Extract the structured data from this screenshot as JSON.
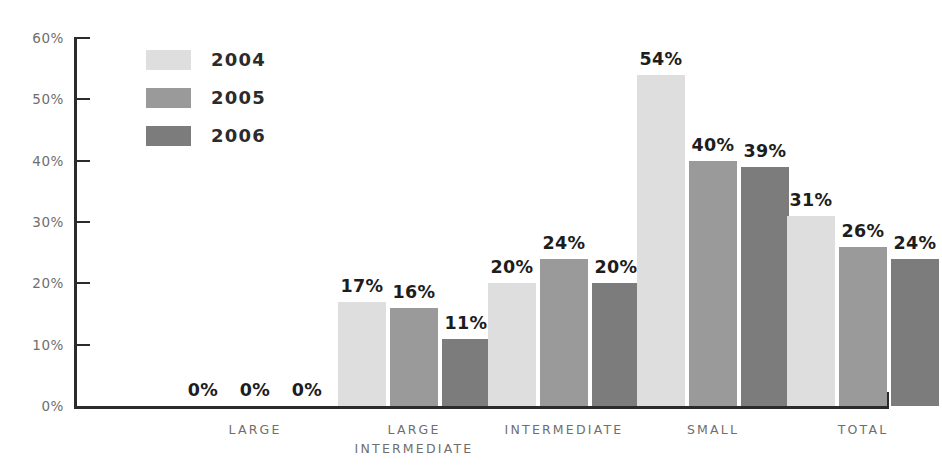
{
  "chart_data": {
    "type": "bar",
    "title": "",
    "subtitle": "",
    "xlabel": "",
    "ylabel": "",
    "categories": [
      "LARGE",
      "LARGE\nINTERMEDIATE",
      "INTERMEDIATE",
      "SMALL",
      "TOTAL"
    ],
    "series": [
      {
        "name": "2004",
        "color": "#dedede",
        "values": [
          0,
          17,
          20,
          54,
          31
        ]
      },
      {
        "name": "2005",
        "color": "#9a9a9a",
        "values": [
          0,
          16,
          24,
          40,
          26
        ]
      },
      {
        "name": "2006",
        "color": "#7c7c7c",
        "values": [
          0,
          11,
          20,
          39,
          24
        ]
      }
    ],
    "value_labels": [
      [
        "0%",
        "0%",
        "0%"
      ],
      [
        "17%",
        "16%",
        "11%"
      ],
      [
        "20%",
        "24%",
        "20%"
      ],
      [
        "54%",
        "40%",
        "39%"
      ],
      [
        "31%",
        "26%",
        "24%"
      ]
    ],
    "ylim": [
      0,
      60
    ],
    "y_ticks": [
      0,
      10,
      20,
      30,
      40,
      50,
      60
    ],
    "y_tick_labels": [
      "0%",
      "10%",
      "20%",
      "30%",
      "40%",
      "50%",
      "60%"
    ],
    "grid": false,
    "legend_position": "top-left",
    "value_label_suffix": "%"
  },
  "axis": {
    "line_color": "#2b2b2b",
    "tick_label_color": "#6e6e6e"
  },
  "legend": {
    "entries": [
      {
        "label": "2004",
        "color": "#dedede"
      },
      {
        "label": "2005",
        "color": "#9a9a9a"
      },
      {
        "label": "2006",
        "color": "#7c7c7c"
      }
    ]
  }
}
